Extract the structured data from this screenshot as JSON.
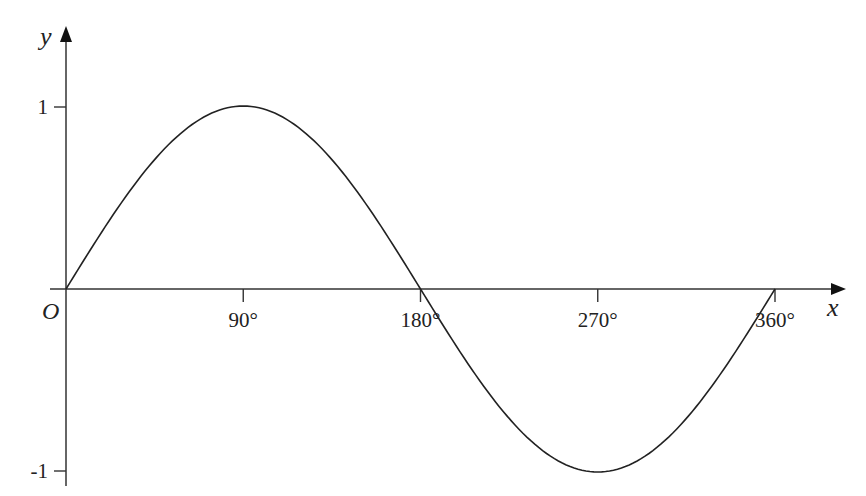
{
  "chart_data": {
    "type": "line",
    "title": "",
    "function": "y = sin x",
    "xlabel": "x",
    "ylabel": "y",
    "origin_label": "O",
    "x": [
      0,
      30,
      60,
      90,
      120,
      150,
      180,
      210,
      240,
      270,
      300,
      330,
      360
    ],
    "series": [
      {
        "name": "sin x",
        "values": [
          0,
          0.5,
          0.866,
          1,
          0.866,
          0.5,
          0,
          -0.5,
          -0.866,
          -1,
          -0.866,
          -0.5,
          0
        ]
      }
    ],
    "x_ticks": [
      "90°",
      "180°",
      "270°",
      "360°"
    ],
    "x_tick_values": [
      90,
      180,
      270,
      360
    ],
    "y_ticks": [
      "1",
      "-1"
    ],
    "y_tick_values": [
      1,
      -1
    ],
    "xlim": [
      0,
      360
    ],
    "ylim": [
      -1,
      1
    ],
    "grid": false,
    "legend": "none",
    "line_color": "#222222"
  }
}
